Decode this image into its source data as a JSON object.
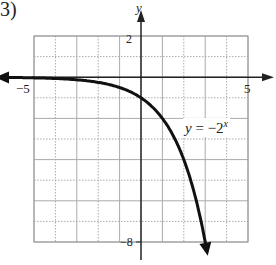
{
  "problem_number": "3)",
  "chart_data": {
    "type": "line",
    "title": "",
    "function_label": "y = −2^x",
    "xlabel": "",
    "ylabel": "y",
    "xlim": [
      -5,
      5
    ],
    "ylim": [
      -8,
      2
    ],
    "grid": true,
    "grid_step": 1,
    "tick_labels": {
      "x": [
        {
          "value": -5,
          "label": "−5"
        },
        {
          "value": 5,
          "label": "5"
        }
      ],
      "y": [
        {
          "value": 2,
          "label": "2"
        },
        {
          "value": -8,
          "label": "−8"
        }
      ]
    },
    "series": [
      {
        "name": "y = -2^x",
        "x": [
          -5.8,
          -5,
          -4,
          -3,
          -2,
          -1,
          0,
          1,
          2,
          2.5,
          3,
          3.1
        ],
        "values": [
          -0.018,
          -0.031,
          -0.0625,
          -0.125,
          -0.25,
          -0.5,
          -1,
          -2,
          -4,
          -5.66,
          -8,
          -8.57
        ],
        "arrows": "both"
      }
    ]
  },
  "labels": {
    "y_axis": "y",
    "x_tick_neg": "−5",
    "x_tick_pos": "5",
    "y_tick_top": "2",
    "y_tick_bottom": "−8",
    "eq_y": "y",
    "eq_eq": " = −2",
    "eq_exp": "x"
  }
}
